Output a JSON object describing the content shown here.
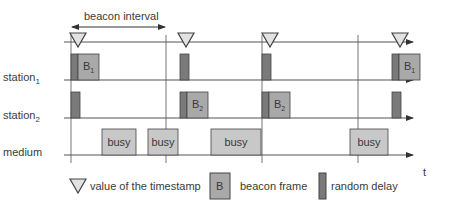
{
  "title": "beacon interval",
  "axis_label": "t",
  "rows": [
    {
      "id": "beacon",
      "label": "",
      "y": 42
    },
    {
      "id": "station1",
      "label": "station",
      "subscript": "1",
      "y": 80
    },
    {
      "id": "station2",
      "label": "station",
      "subscript": "2",
      "y": 118
    },
    {
      "id": "medium",
      "label": "medium",
      "y": 155
    }
  ],
  "interval_lines_x": [
    71,
    166,
    262,
    358
  ],
  "timestamps_x": [
    78,
    186,
    270,
    400
  ],
  "station1_blocks": [
    {
      "delay_x": 71,
      "delay_w": 7,
      "beacon": true,
      "beacon_x": 78,
      "beacon_w": 21,
      "label": "B",
      "sub": "1"
    },
    {
      "delay_x": 180,
      "delay_w": 9,
      "beacon": false
    },
    {
      "delay_x": 262,
      "delay_w": 9,
      "beacon": false
    },
    {
      "delay_x": 392,
      "delay_w": 7,
      "beacon": true,
      "beacon_x": 399,
      "beacon_w": 21,
      "label": "B",
      "sub": "1"
    }
  ],
  "station2_blocks": [
    {
      "delay_x": 71,
      "delay_w": 9,
      "beacon": false
    },
    {
      "delay_x": 180,
      "delay_w": 7,
      "beacon": true,
      "beacon_x": 187,
      "beacon_w": 21,
      "label": "B",
      "sub": "2"
    },
    {
      "delay_x": 262,
      "delay_w": 7,
      "beacon": true,
      "beacon_x": 269,
      "beacon_w": 21,
      "label": "B",
      "sub": "2"
    },
    {
      "delay_x": 392,
      "delay_w": 9,
      "beacon": false
    }
  ],
  "medium_blocks": [
    {
      "x": 102,
      "w": 34,
      "label": "busy"
    },
    {
      "x": 148,
      "w": 30,
      "label": "busy"
    },
    {
      "x": 211,
      "w": 50,
      "label": "busy"
    },
    {
      "x": 350,
      "w": 38,
      "label": "busy"
    }
  ],
  "legend": {
    "timestamp": "value of the timestamp",
    "beacon_symbol": "B",
    "beacon": "beacon frame",
    "delay": "random delay"
  },
  "colors": {
    "line": "#555555",
    "delay_fill": "#7a7a7a",
    "beacon_fill": "#a9a9a9",
    "busy_fill": "#c8c8c8",
    "triangle_fill": "#e2e2e2"
  }
}
